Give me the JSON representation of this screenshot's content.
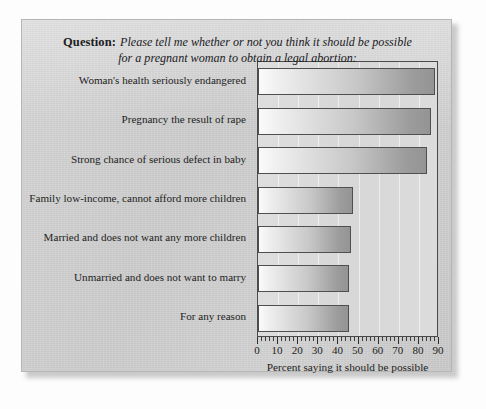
{
  "question": {
    "label": "Question:",
    "line1": "Please tell me whether or not you think it should be possible",
    "line2": "for a pregnant woman to obtain a legal abortion:"
  },
  "chart_data": {
    "type": "bar",
    "orientation": "horizontal",
    "title": "Please tell me whether or not you think it should be possible for a pregnant woman to obtain a legal abortion:",
    "xlabel": "Percent saying it should be possible",
    "ylabel": "",
    "xlim": [
      0,
      90
    ],
    "xticks": [
      0,
      10,
      20,
      30,
      40,
      50,
      60,
      70,
      80,
      90
    ],
    "xtick_labels": [
      "0",
      "10",
      "20",
      "30",
      "40",
      "50",
      "60",
      "70",
      "80",
      "90"
    ],
    "minor_tick_step": 2,
    "grid": true,
    "legend": false,
    "categories": [
      "Woman's health seriously endangered",
      "Pregnancy the result of rape",
      "Strong chance of serious defect in baby",
      "Family low-income, cannot afford more children",
      "Married and does not want any more children",
      "Unmarried and does not want to marry",
      "For any reason"
    ],
    "values": [
      88,
      86,
      84,
      47,
      46,
      45,
      45
    ]
  },
  "colors": {
    "panel_background": "#cbcbcb",
    "plot_background": "#dadada",
    "bar_gradient_start": "#fbfbfb",
    "bar_gradient_end": "#949494",
    "bar_border": "#4f4f4f",
    "axis": "#3e3e3e",
    "text": "#232322"
  }
}
